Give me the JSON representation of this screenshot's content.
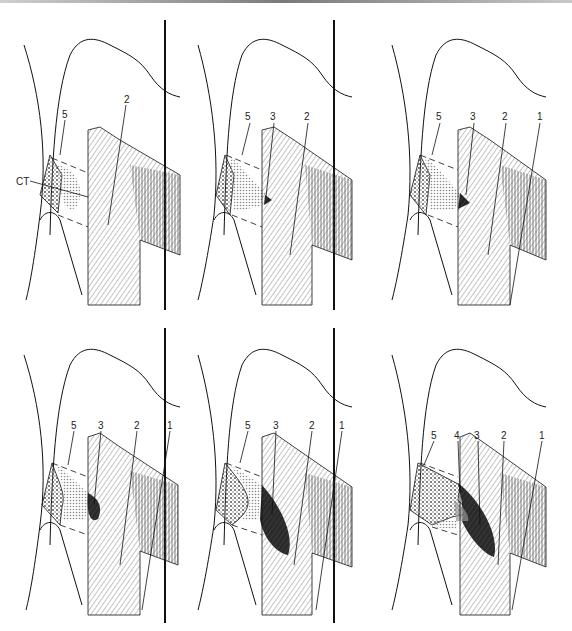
{
  "figure": {
    "type": "multi-panel anatomical line drawing",
    "layout": {
      "rows": 2,
      "cols": 3
    },
    "colors": {
      "ink": "#111111",
      "hatch": "#555555",
      "stipple": "#888888",
      "lesion": "#333333",
      "background": "#ffffff"
    }
  },
  "panels": [
    {
      "id": "A",
      "labels": [
        "CT",
        "5",
        "2"
      ]
    },
    {
      "id": "B",
      "labels": [
        "5",
        "3",
        "2"
      ]
    },
    {
      "id": "C",
      "labels": [
        "5",
        "3",
        "2",
        "1"
      ]
    },
    {
      "id": "D",
      "labels": [
        "5",
        "3",
        "2",
        "1"
      ]
    },
    {
      "id": "E",
      "labels": [
        "5",
        "3",
        "2",
        "1"
      ]
    },
    {
      "id": "F",
      "labels": [
        "5",
        "4",
        "3",
        "2",
        "1"
      ]
    }
  ],
  "text": {
    "ct": "CT",
    "n1": "1",
    "n2": "2",
    "n3": "3",
    "n4": "4",
    "n5": "5"
  }
}
